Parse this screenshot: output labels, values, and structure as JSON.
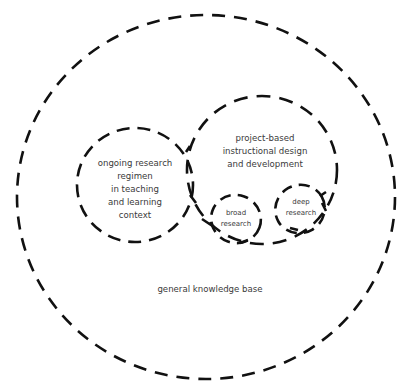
{
  "diagram": {
    "type": "nested-dashed-circles",
    "stroke_color": "#111111",
    "text_color": "#3a3a3a",
    "background": "#ffffff",
    "regions": [
      {
        "id": "general-knowledge-base",
        "label": "general knowledge base",
        "contains": [
          "ongoing-research-regimen",
          "project-based-design"
        ]
      },
      {
        "id": "ongoing-research-regimen",
        "label_lines": [
          "ongoing research",
          "regimen",
          "in teaching",
          "and learning",
          "context"
        ]
      },
      {
        "id": "project-based-design",
        "label_lines": [
          "project-based",
          "instructional design",
          "and development"
        ],
        "contains": [
          "broad-research",
          "deep-research"
        ]
      },
      {
        "id": "broad-research",
        "label_lines": [
          "broad",
          "research"
        ]
      },
      {
        "id": "deep-research",
        "label_lines": [
          "deep",
          "research"
        ]
      }
    ]
  },
  "labels": {
    "base": "general knowledge base",
    "ongoing": [
      "ongoing research",
      "regimen",
      "in teaching",
      "and learning",
      "context"
    ],
    "project": [
      "project-based",
      "instructional design",
      "and development"
    ],
    "broad": [
      "broad",
      "research"
    ],
    "deep": [
      "deep",
      "research"
    ]
  }
}
